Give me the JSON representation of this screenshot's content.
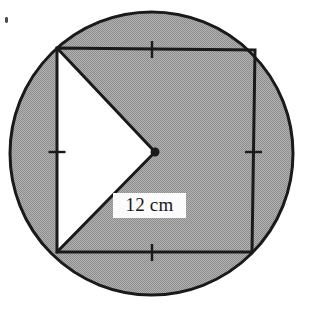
{
  "figure": {
    "kind": "geometry-diagram",
    "canvas": {
      "width": 309,
      "height": 331
    },
    "colors": {
      "stroke": "#1a1a1a",
      "shaded_fill": "#a0a0a0",
      "unshaded_fill": "#ffffff",
      "page_background": "#ffffff",
      "label_background": "#fbfbfb",
      "label_text": "#1a1a1a"
    },
    "circle": {
      "label": "circumscribed-circle",
      "cx": 151.5,
      "cy": 153.5,
      "r": 141.5,
      "stroke_width": 3
    },
    "square": {
      "label": "inscribed-square",
      "stroke_width": 3,
      "vertices": [
        {
          "name": "top-left",
          "x": 57,
          "y": 48
        },
        {
          "name": "top-right",
          "x": 255,
          "y": 50
        },
        {
          "name": "bottom-right",
          "x": 252,
          "y": 252
        },
        {
          "name": "bottom-left",
          "x": 57,
          "y": 252
        }
      ]
    },
    "centre_point": {
      "label": "centre-dot",
      "x": 155,
      "y": 152,
      "r": 4.5
    },
    "notch": {
      "label": "chevron-notch",
      "description": "White triangular wedge from top-left corner to centre to bottom-left corner",
      "points": [
        {
          "x": 57,
          "y": 48
        },
        {
          "x": 155,
          "y": 152
        },
        {
          "x": 57,
          "y": 252
        }
      ]
    },
    "tick_marks": [
      {
        "name": "tick-top-edge",
        "x": 152,
        "y": 49,
        "orientation": "vertical",
        "length": 17
      },
      {
        "name": "tick-right-edge",
        "x": 253.5,
        "y": 152,
        "orientation": "horizontal",
        "length": 17
      },
      {
        "name": "tick-bottom-edge",
        "x": 152,
        "y": 252,
        "orientation": "vertical",
        "length": 17
      },
      {
        "name": "tick-left-edge",
        "x": 57,
        "y": 152,
        "orientation": "horizontal",
        "length": 17
      }
    ],
    "measurement_label": {
      "name": "radius-length-label",
      "text": "12 cm",
      "x": 113,
      "y": 193,
      "width": 67,
      "height": 25
    },
    "scan_artifact": {
      "name": "scan-speck",
      "x": 5,
      "y": 17,
      "width": 3,
      "height": 6
    }
  }
}
